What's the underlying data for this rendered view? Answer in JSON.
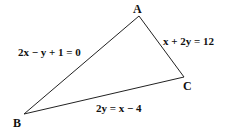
{
  "diagram": {
    "type": "triangle",
    "colors": {
      "line": "#222222",
      "text": "#111111",
      "background": "#ffffff"
    },
    "vertices": {
      "A": {
        "label": "A"
      },
      "B": {
        "label": "B"
      },
      "C": {
        "label": "C"
      }
    },
    "sides": {
      "AB": {
        "equation": "2x − y + 1 = 0"
      },
      "AC": {
        "equation": "x + 2y = 12"
      },
      "BC": {
        "equation": "2y = x − 4"
      }
    }
  }
}
